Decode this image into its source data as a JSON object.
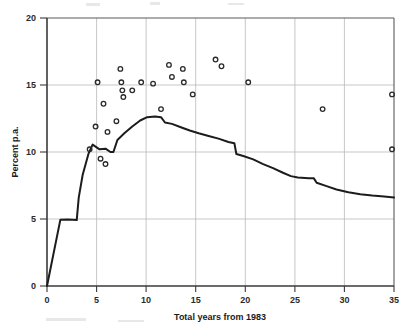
{
  "chart_data": {
    "type": "scatter",
    "title": "",
    "subtitle": "",
    "xlabel": "Total years from 1983",
    "ylabel": "Percent p.a.",
    "xlim": [
      0,
      35
    ],
    "ylim": [
      0,
      20
    ],
    "xticks": [
      0,
      5,
      10,
      15,
      20,
      25,
      30,
      35
    ],
    "yticks": [
      0,
      5,
      10,
      15,
      20
    ],
    "xtick_labels": [
      "0",
      "5",
      "10",
      "15",
      "20",
      "25",
      "30",
      "35"
    ],
    "ytick_labels": [
      "0",
      "5",
      "10",
      "15",
      "20"
    ],
    "grid": true,
    "legend": "none",
    "series": [
      {
        "name": "Observations",
        "type": "scatter",
        "marker": "open-circle",
        "color": "#2a2a2a",
        "points": [
          {
            "x": 4.3,
            "y": 10.2
          },
          {
            "x": 4.9,
            "y": 11.9
          },
          {
            "x": 5.1,
            "y": 15.2
          },
          {
            "x": 5.4,
            "y": 9.5
          },
          {
            "x": 5.7,
            "y": 13.6
          },
          {
            "x": 5.9,
            "y": 9.1
          },
          {
            "x": 6.1,
            "y": 11.5
          },
          {
            "x": 7.0,
            "y": 12.3
          },
          {
            "x": 7.4,
            "y": 16.2
          },
          {
            "x": 7.5,
            "y": 15.2
          },
          {
            "x": 7.6,
            "y": 14.6
          },
          {
            "x": 7.7,
            "y": 14.1
          },
          {
            "x": 8.6,
            "y": 14.6
          },
          {
            "x": 9.5,
            "y": 15.2
          },
          {
            "x": 10.7,
            "y": 15.1
          },
          {
            "x": 11.5,
            "y": 13.2
          },
          {
            "x": 12.3,
            "y": 16.5
          },
          {
            "x": 12.6,
            "y": 15.6
          },
          {
            "x": 13.7,
            "y": 16.2
          },
          {
            "x": 13.8,
            "y": 15.2
          },
          {
            "x": 14.7,
            "y": 14.3
          },
          {
            "x": 17.0,
            "y": 16.9
          },
          {
            "x": 17.6,
            "y": 16.4
          },
          {
            "x": 20.3,
            "y": 15.2
          },
          {
            "x": 27.8,
            "y": 13.2
          },
          {
            "x": 34.8,
            "y": 14.3
          },
          {
            "x": 34.8,
            "y": 10.2
          }
        ]
      },
      {
        "name": "Rate curve",
        "type": "line",
        "color": "#1c1c1c",
        "points": [
          {
            "x": 0.0,
            "y": 0.0
          },
          {
            "x": 1.35,
            "y": 4.95
          },
          {
            "x": 2.1,
            "y": 4.97
          },
          {
            "x": 3.0,
            "y": 4.92
          },
          {
            "x": 3.2,
            "y": 6.6
          },
          {
            "x": 3.6,
            "y": 8.3
          },
          {
            "x": 4.2,
            "y": 9.9
          },
          {
            "x": 4.6,
            "y": 10.55
          },
          {
            "x": 5.3,
            "y": 10.2
          },
          {
            "x": 5.9,
            "y": 10.25
          },
          {
            "x": 6.4,
            "y": 10.0
          },
          {
            "x": 6.7,
            "y": 10.0
          },
          {
            "x": 7.1,
            "y": 10.9
          },
          {
            "x": 7.8,
            "y": 11.4
          },
          {
            "x": 8.6,
            "y": 11.9
          },
          {
            "x": 9.4,
            "y": 12.35
          },
          {
            "x": 10.1,
            "y": 12.6
          },
          {
            "x": 10.9,
            "y": 12.65
          },
          {
            "x": 11.5,
            "y": 12.6
          },
          {
            "x": 11.9,
            "y": 12.2
          },
          {
            "x": 12.6,
            "y": 12.1
          },
          {
            "x": 13.5,
            "y": 11.85
          },
          {
            "x": 14.4,
            "y": 11.6
          },
          {
            "x": 15.3,
            "y": 11.4
          },
          {
            "x": 16.3,
            "y": 11.2
          },
          {
            "x": 17.3,
            "y": 11.0
          },
          {
            "x": 18.3,
            "y": 10.75
          },
          {
            "x": 18.9,
            "y": 10.65
          },
          {
            "x": 19.1,
            "y": 9.85
          },
          {
            "x": 19.8,
            "y": 9.7
          },
          {
            "x": 20.8,
            "y": 9.45
          },
          {
            "x": 21.8,
            "y": 9.1
          },
          {
            "x": 22.8,
            "y": 8.8
          },
          {
            "x": 23.8,
            "y": 8.45
          },
          {
            "x": 24.6,
            "y": 8.2
          },
          {
            "x": 25.3,
            "y": 8.1
          },
          {
            "x": 26.4,
            "y": 8.05
          },
          {
            "x": 26.9,
            "y": 8.05
          },
          {
            "x": 27.2,
            "y": 7.7
          },
          {
            "x": 28.2,
            "y": 7.45
          },
          {
            "x": 29.2,
            "y": 7.2
          },
          {
            "x": 30.4,
            "y": 7.0
          },
          {
            "x": 31.6,
            "y": 6.85
          },
          {
            "x": 32.8,
            "y": 6.75
          },
          {
            "x": 34.0,
            "y": 6.68
          },
          {
            "x": 35.0,
            "y": 6.6
          }
        ]
      }
    ],
    "colors": {
      "line": "#1c1c1c",
      "marker": "#2a2a2a",
      "grid": "#b9b9b9",
      "axis": "#3a3a3a",
      "background": "#ffffff"
    }
  }
}
